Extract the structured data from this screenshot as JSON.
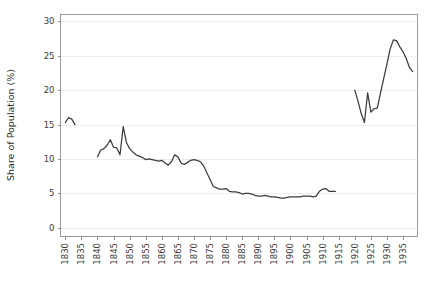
{
  "chart_data": {
    "type": "line",
    "title": "",
    "subtitle": "",
    "xlabel": "",
    "ylabel": "Share of Population (%)",
    "xlim": [
      1828.5,
      1939.5
    ],
    "ylim": [
      -1.2,
      31.0
    ],
    "yticks": [
      0,
      5,
      10,
      15,
      20,
      25,
      30
    ],
    "ytick_labels": [
      "0",
      "5",
      "10",
      "15",
      "20",
      "25",
      "30"
    ],
    "xticks": [
      1830,
      1835,
      1840,
      1845,
      1850,
      1855,
      1860,
      1865,
      1870,
      1875,
      1880,
      1885,
      1890,
      1895,
      1900,
      1905,
      1910,
      1915,
      1920,
      1925,
      1930,
      1935
    ],
    "xtick_labels": [
      "1830",
      "1835",
      "1840",
      "1845",
      "1850",
      "1855",
      "1860",
      "1865",
      "1870",
      "1875",
      "1880",
      "1885",
      "1890",
      "1895",
      "1900",
      "1905",
      "1910",
      "1915",
      "1920",
      "1925",
      "1930",
      "1935"
    ],
    "grid": "horizontal",
    "legend": "none",
    "line_color": "#3b3b3b",
    "grid_color": "#ececec",
    "axis_color": "#9a9a9a",
    "series": [
      {
        "name": "Share of Population",
        "segments": [
          {
            "label": "1830-1833",
            "x": [
              1830,
              1831,
              1832,
              1833
            ],
            "y": [
              15.3,
              16.0,
              15.8,
              15.0
            ]
          },
          {
            "label": "1840-1914",
            "x": [
              1840,
              1841,
              1842,
              1843,
              1844,
              1845,
              1846,
              1847,
              1848,
              1849,
              1850,
              1851,
              1852,
              1853,
              1854,
              1855,
              1856,
              1857,
              1858,
              1859,
              1860,
              1861,
              1862,
              1863,
              1864,
              1865,
              1866,
              1867,
              1868,
              1869,
              1870,
              1871,
              1872,
              1873,
              1874,
              1875,
              1876,
              1877,
              1878,
              1879,
              1880,
              1881,
              1882,
              1883,
              1884,
              1885,
              1886,
              1887,
              1888,
              1889,
              1890,
              1891,
              1892,
              1893,
              1894,
              1895,
              1896,
              1897,
              1898,
              1899,
              1900,
              1901,
              1902,
              1903,
              1904,
              1905,
              1906,
              1907,
              1908,
              1909,
              1910,
              1911,
              1912,
              1913,
              1914
            ],
            "y": [
              10.3,
              11.3,
              11.5,
              12.0,
              12.8,
              11.7,
              11.6,
              10.6,
              14.7,
              12.4,
              11.5,
              11.0,
              10.6,
              10.4,
              10.2,
              9.9,
              10.0,
              9.9,
              9.8,
              9.7,
              9.8,
              9.4,
              9.1,
              9.6,
              10.6,
              10.3,
              9.4,
              9.2,
              9.5,
              9.8,
              9.9,
              9.8,
              9.6,
              9.0,
              8.0,
              7.0,
              6.0,
              5.8,
              5.6,
              5.6,
              5.7,
              5.3,
              5.2,
              5.2,
              5.1,
              4.9,
              5.0,
              5.0,
              4.9,
              4.7,
              4.6,
              4.6,
              4.7,
              4.6,
              4.5,
              4.5,
              4.4,
              4.3,
              4.3,
              4.4,
              4.5,
              4.5,
              4.5,
              4.5,
              4.6,
              4.6,
              4.6,
              4.5,
              4.6,
              5.3,
              5.6,
              5.7,
              5.3,
              5.3,
              5.3
            ]
          },
          {
            "label": "1920-1938",
            "x": [
              1920,
              1921,
              1922,
              1923,
              1924,
              1925,
              1926,
              1927,
              1928,
              1929,
              1930,
              1931,
              1932,
              1933,
              1934,
              1935,
              1936,
              1937,
              1938
            ],
            "y": [
              20.0,
              18.4,
              16.6,
              15.3,
              19.6,
              16.8,
              17.3,
              17.4,
              19.6,
              21.7,
              23.8,
              26.0,
              27.3,
              27.2,
              26.3,
              25.6,
              24.6,
              23.3,
              22.7
            ]
          }
        ]
      }
    ]
  }
}
